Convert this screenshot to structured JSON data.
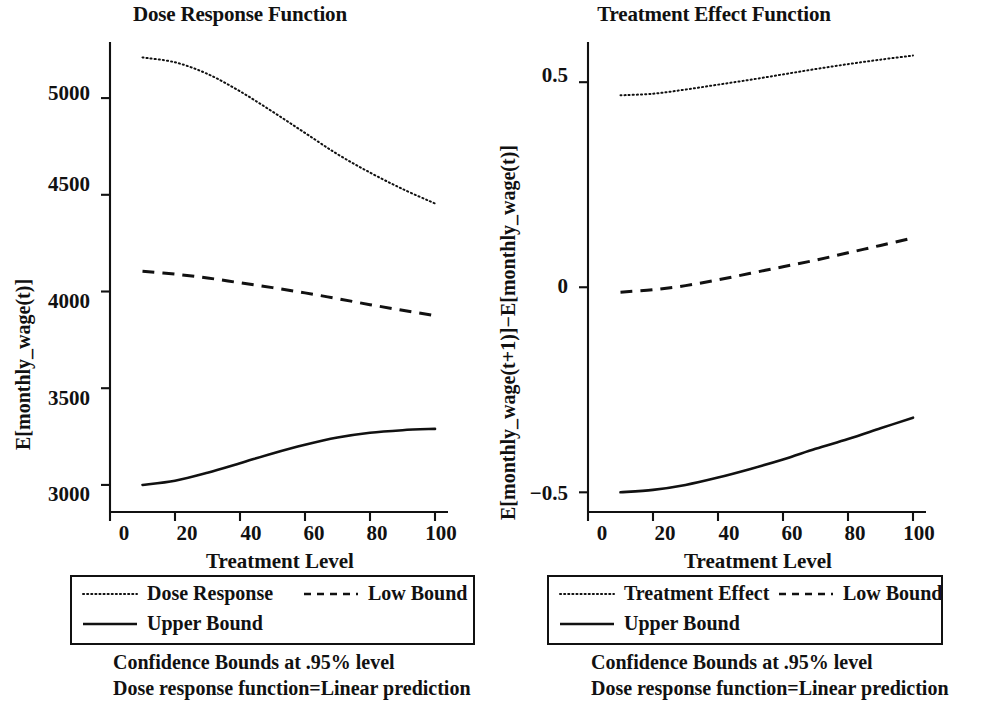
{
  "chart_data": [
    {
      "type": "line",
      "title": "Dose Response Function",
      "xlabel": "Treatment Level",
      "ylabel": "E[monthly_wage(t)]",
      "xlim": [
        0,
        104
      ],
      "ylim": [
        2860,
        5290
      ],
      "xticks": [
        0,
        20,
        40,
        60,
        80,
        100
      ],
      "xtick_labels": [
        "0",
        "20",
        "40",
        "60",
        "80",
        "100"
      ],
      "yticks": [
        3000,
        3500,
        4000,
        4500,
        5000
      ],
      "ytick_labels": [
        "3000",
        "3500",
        "4000",
        "4500",
        "5000"
      ],
      "grid": false,
      "legend_position": "below",
      "x": [
        10,
        20,
        30,
        40,
        50,
        60,
        70,
        80,
        90,
        100
      ],
      "series": [
        {
          "name": "Dose Response",
          "style": "dotted",
          "values": [
            5210,
            5185,
            5125,
            5035,
            4930,
            4820,
            4710,
            4615,
            4530,
            4455
          ]
        },
        {
          "name": "Low Bound",
          "style": "dashed",
          "values": [
            4105,
            4090,
            4070,
            4045,
            4020,
            3993,
            3963,
            3932,
            3903,
            3875
          ]
        },
        {
          "name": "Upper Bound",
          "style": "solid",
          "values": [
            3000,
            3022,
            3063,
            3112,
            3163,
            3208,
            3245,
            3270,
            3283,
            3290
          ]
        }
      ],
      "notes": [
        "Confidence Bounds at .95% level",
        "Dose response function=Linear prediction"
      ]
    },
    {
      "type": "line",
      "title": "Treatment Effect Function",
      "xlabel": "Treatment Level",
      "ylabel": "E[monthly_wage(t+1)]−E[monthly_wage(t)]",
      "xlim": [
        0,
        104
      ],
      "ylim": [
        -0.548,
        0.598
      ],
      "xticks": [
        0,
        20,
        40,
        60,
        80,
        100
      ],
      "xtick_labels": [
        "0",
        "20",
        "40",
        "60",
        "80",
        "100"
      ],
      "yticks": [
        -0.5,
        0,
        0.5
      ],
      "ytick_labels": [
        "−0.5",
        "0",
        "0.5"
      ],
      "grid": false,
      "legend_position": "below",
      "x": [
        10,
        20,
        30,
        40,
        50,
        60,
        70,
        80,
        90,
        100
      ],
      "series": [
        {
          "name": "Treatment Effect",
          "style": "dotted",
          "values": [
            0.468,
            0.472,
            0.482,
            0.494,
            0.506,
            0.519,
            0.532,
            0.544,
            0.555,
            0.565
          ]
        },
        {
          "name": "Low Bound",
          "style": "dashed",
          "values": [
            -0.012,
            -0.006,
            0.004,
            0.018,
            0.034,
            0.05,
            0.066,
            0.084,
            0.102,
            0.12
          ]
        },
        {
          "name": "Upper Bound",
          "style": "solid",
          "values": [
            -0.5,
            -0.494,
            -0.482,
            -0.464,
            -0.443,
            -0.42,
            -0.394,
            -0.37,
            -0.344,
            -0.318
          ]
        }
      ],
      "notes": [
        "Confidence Bounds at .95% level",
        "Dose response function=Linear prediction"
      ]
    }
  ],
  "left": {
    "title": "Dose Response Function",
    "xlabel": "Treatment Level",
    "ylabel": "E[monthly_wage(t)]",
    "xtick_labels": [
      "0",
      "20",
      "40",
      "60",
      "80",
      "100"
    ],
    "ytick_labels": [
      "3000",
      "3500",
      "4000",
      "4500",
      "5000"
    ],
    "legend": [
      {
        "label": "Dose Response",
        "style": "dotted"
      },
      {
        "label": "Low Bound",
        "style": "dashed"
      },
      {
        "label": "Upper Bound",
        "style": "solid"
      }
    ],
    "notes": [
      "Confidence Bounds at .95% level",
      "Dose response function=Linear prediction"
    ]
  },
  "right": {
    "title": "Treatment Effect Function",
    "xlabel": "Treatment Level",
    "ylabel": "E[monthly_wage(t+1)]−E[monthly_wage(t)]",
    "xtick_labels": [
      "0",
      "20",
      "40",
      "60",
      "80",
      "100"
    ],
    "ytick_labels": [
      "−0.5",
      "0",
      "0.5"
    ],
    "legend": [
      {
        "label": "Treatment Effect",
        "style": "dotted"
      },
      {
        "label": "Low Bound",
        "style": "dashed"
      },
      {
        "label": "Upper Bound",
        "style": "solid"
      }
    ],
    "notes": [
      "Confidence Bounds at .95% level",
      "Dose response function=Linear prediction"
    ]
  },
  "colors": {
    "ink": "#111111",
    "background": "#ffffff"
  }
}
